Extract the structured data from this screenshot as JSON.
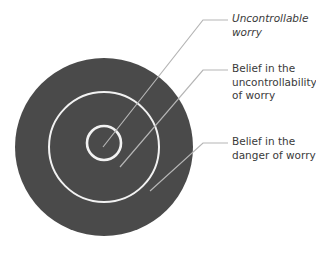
{
  "diagram": {
    "colors": {
      "outer_circle": "#4a4a4a",
      "ring_stroke": "#f2f2f2",
      "leader_line": "#b5b5b5",
      "leader_line_outside": "#9a9a9a",
      "text": "#3a3a3a",
      "background": "#ffffff"
    },
    "layers": [
      {
        "id": "inner",
        "label_lines": [
          "Uncontrollable",
          "worry"
        ],
        "italic": true
      },
      {
        "id": "middle",
        "label_lines": [
          "Belief in the",
          "uncontrollability",
          "of worry"
        ],
        "italic": false
      },
      {
        "id": "outer",
        "label_lines": [
          "Belief in the",
          "danger of worry"
        ],
        "italic": false
      }
    ]
  }
}
